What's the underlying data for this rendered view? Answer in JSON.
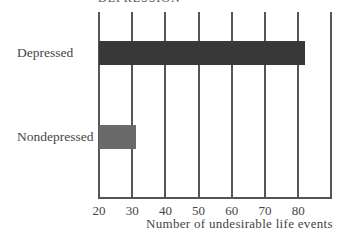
{
  "chart_data": {
    "type": "bar",
    "orientation": "horizontal",
    "title": "DEPRESSION",
    "categories": [
      "Depressed",
      "Nondepressed"
    ],
    "values": [
      82,
      31
    ],
    "series": [
      {
        "name": "Undesirable life events",
        "values": [
          82,
          31
        ]
      }
    ],
    "bar_colors": [
      "#383838",
      "#6a6a6a"
    ],
    "xlabel": "Number of undesirable life events",
    "ylabel": "",
    "xlim": [
      20,
      90
    ],
    "xticks": [
      "20",
      "30",
      "40",
      "50",
      "60",
      "70",
      "80"
    ],
    "grid": true,
    "legend": "none"
  },
  "header": {
    "title": "DEPRESSION"
  },
  "axis": {
    "xlabel": "Number of undesirable life events",
    "ticks": [
      "20",
      "30",
      "40",
      "50",
      "60",
      "70",
      "80"
    ]
  },
  "bars": [
    {
      "label": "Depressed",
      "value": 82,
      "color": "#383838"
    },
    {
      "label": "Nondepressed",
      "value": 31,
      "color": "#6a6a6a"
    }
  ]
}
